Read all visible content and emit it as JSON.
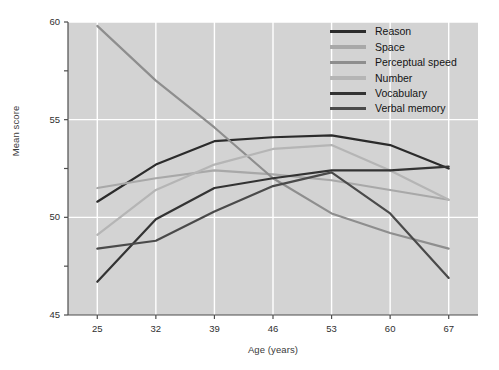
{
  "chart_data": {
    "type": "line",
    "title": "",
    "xlabel": "Age (years)",
    "ylabel": "Mean score",
    "x": [
      25,
      32,
      39,
      46,
      53,
      60,
      67
    ],
    "xlim": [
      21.5,
      70.5
    ],
    "ylim": [
      45,
      60
    ],
    "x_ticks": [
      "25",
      "32",
      "39",
      "46",
      "53",
      "60",
      "67"
    ],
    "y_ticks": [
      "45",
      "50",
      "55",
      "60"
    ],
    "y_minor_ticks": [
      "47.5",
      "52.5",
      "57.5"
    ],
    "grid": "white gridlines on gray panel, major only",
    "legend_position": "top-right inside axes",
    "series": [
      {
        "name": "Reason",
        "color": "#2b2b2b",
        "values": [
          50.8,
          52.7,
          53.9,
          54.1,
          54.2,
          53.7,
          52.5
        ]
      },
      {
        "name": "Space",
        "color": "#a8a8a8",
        "values": [
          51.5,
          52.0,
          52.4,
          52.2,
          51.9,
          51.4,
          50.9
        ]
      },
      {
        "name": "Perceptual speed",
        "color": "#8e8e8e",
        "values": [
          59.8,
          57.0,
          54.6,
          52.0,
          50.2,
          49.2,
          48.4
        ]
      },
      {
        "name": "Number",
        "color": "#b5b5b5",
        "values": [
          49.1,
          51.4,
          52.7,
          53.5,
          53.7,
          52.4,
          50.9
        ]
      },
      {
        "name": "Vocabulary",
        "color": "#333333",
        "values": [
          46.7,
          49.9,
          51.5,
          52.0,
          52.4,
          52.4,
          52.6
        ]
      },
      {
        "name": "Verbal memory",
        "color": "#4a4a4a",
        "values": [
          48.4,
          48.8,
          50.3,
          51.6,
          52.3,
          50.2,
          46.9
        ]
      }
    ]
  },
  "panel": {
    "background": "#d3d3d3",
    "gridline_color": "#ffffff",
    "axis_color": "#4d4d4d"
  },
  "legend": {
    "items": [
      {
        "label": "Reason"
      },
      {
        "label": "Space"
      },
      {
        "label": "Perceptual speed"
      },
      {
        "label": "Number"
      },
      {
        "label": "Vocabulary"
      },
      {
        "label": "Verbal memory"
      }
    ]
  }
}
